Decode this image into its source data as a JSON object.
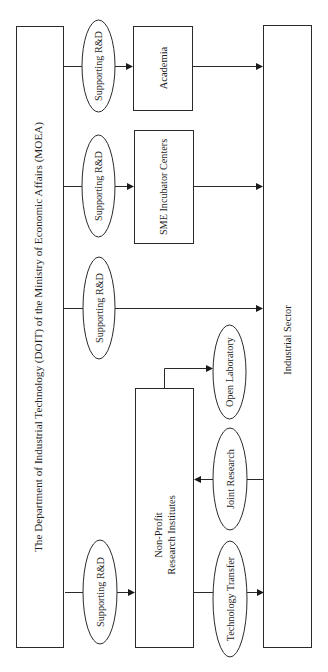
{
  "diagram": {
    "orientation": "rotated-90-ccw",
    "colors": {
      "stroke": "#2a2a2a",
      "text": "#1e1e1e",
      "background": "#ffffff"
    },
    "nodes": {
      "doit": {
        "label": "The Department of Industrial Technology (DOIT) of the Ministry of Economic Affairs (MOEA)"
      },
      "academia": {
        "label": "Academia"
      },
      "sme": {
        "label": "SME Incubator Centers"
      },
      "nonprofit": {
        "label_line1": "Non-Profit",
        "label_line2": "Research Institutes"
      },
      "industrial": {
        "label": "Industrial Sector"
      }
    },
    "edge_labels": {
      "support_academia": "Supporting R&D",
      "support_sme": "Supporting R&D",
      "support_industrial": "Supporting R&D",
      "support_nonprofit": "Supporting R&D",
      "open_laboratory": "Open Laboratory",
      "joint_research": "Joint Research",
      "technology_transfer": "Technology Transfer"
    },
    "edges": [
      {
        "from": "doit",
        "to": "academia",
        "label": "Supporting R&D"
      },
      {
        "from": "doit",
        "to": "sme",
        "label": "Supporting R&D"
      },
      {
        "from": "doit",
        "to": "industrial",
        "label": "Supporting R&D"
      },
      {
        "from": "doit",
        "to": "nonprofit",
        "label": "Supporting R&D"
      },
      {
        "from": "academia",
        "to": "industrial",
        "label": ""
      },
      {
        "from": "sme",
        "to": "industrial",
        "label": ""
      },
      {
        "from": "nonprofit",
        "to": "open_laboratory",
        "label": ""
      },
      {
        "from": "industrial",
        "to": "nonprofit",
        "label": "Joint Research"
      },
      {
        "from": "nonprofit",
        "to": "industrial",
        "label": "Technology Transfer"
      }
    ]
  }
}
